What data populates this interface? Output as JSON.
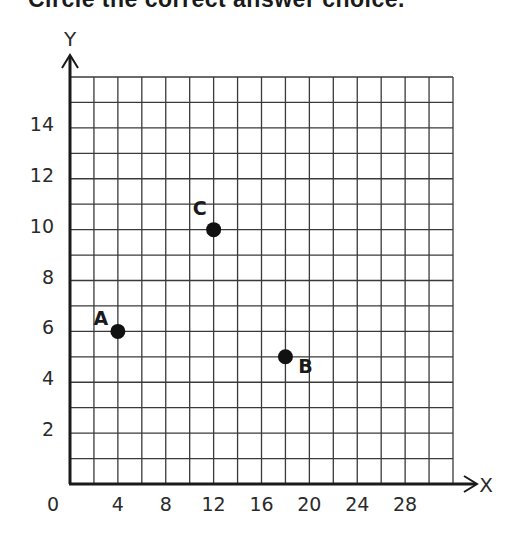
{
  "header": {
    "title": "Circle the correct answer choice."
  },
  "chart_data": {
    "type": "scatter",
    "title": "",
    "xlabel": "X",
    "ylabel": "Y",
    "xlim": [
      0,
      32
    ],
    "ylim": [
      0,
      16
    ],
    "grid": true,
    "x_grid_step": 2,
    "y_grid_step": 1,
    "x_ticks": [
      0,
      4,
      8,
      12,
      16,
      20,
      24,
      28
    ],
    "y_ticks": [
      2,
      4,
      6,
      8,
      10,
      12,
      14
    ],
    "points": [
      {
        "label": "A",
        "x": 4,
        "y": 6
      },
      {
        "label": "B",
        "x": 18,
        "y": 5
      },
      {
        "label": "C",
        "x": 12,
        "y": 10
      }
    ]
  },
  "colors": {
    "grid": "#3a3a3a",
    "axis": "#1a1a1a",
    "point": "#111111"
  }
}
